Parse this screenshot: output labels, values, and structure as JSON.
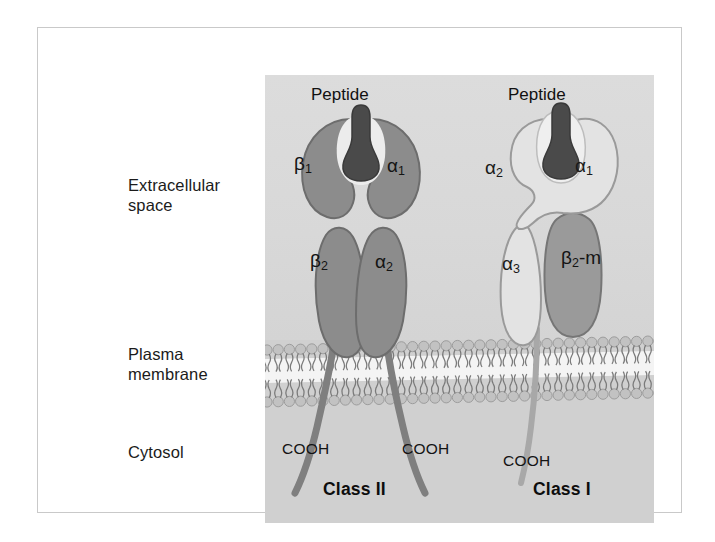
{
  "figure": {
    "panel_background": "#d3d3d3"
  },
  "region_labels": {
    "extracellular": "Extracellular\nspace",
    "plasma_membrane": "Plasma\nmembrane",
    "cytosol": "Cytosol"
  },
  "class_ii": {
    "name": "Class II",
    "peptide_label": "Peptide",
    "domains": [
      {
        "id": "beta1",
        "label": "β1",
        "greek": "β",
        "sub": "1",
        "fill": "#8c8c8c"
      },
      {
        "id": "alpha1",
        "label": "α1",
        "greek": "α",
        "sub": "1",
        "fill": "#8c8c8c"
      },
      {
        "id": "beta2",
        "label": "β2",
        "greek": "β",
        "sub": "2",
        "fill": "#8c8c8c"
      },
      {
        "id": "alpha2",
        "label": "α2",
        "greek": "α",
        "sub": "2",
        "fill": "#8c8c8c"
      }
    ],
    "termini": [
      {
        "id": "cooh-left",
        "label": "COOH"
      },
      {
        "id": "cooh-right",
        "label": "COOH"
      }
    ]
  },
  "class_i": {
    "name": "Class I",
    "peptide_label": "Peptide",
    "domains": [
      {
        "id": "alpha2",
        "label": "α2",
        "greek": "α",
        "sub": "2",
        "fill": "#e0e0e0"
      },
      {
        "id": "alpha1",
        "label": "α1",
        "greek": "α",
        "sub": "1",
        "fill": "#e0e0e0"
      },
      {
        "id": "alpha3",
        "label": "α3",
        "greek": "α",
        "sub": "3",
        "fill": "#e0e0e0"
      },
      {
        "id": "b2m",
        "label": "β2-m",
        "greek": "β",
        "sub": "2",
        "suffix": "-m",
        "fill": "#9a9a9a"
      }
    ],
    "termini": [
      {
        "id": "cooh",
        "label": "COOH"
      }
    ]
  },
  "colors": {
    "peptide": "#4a4a4a",
    "class_ii_protein": "#8c8c8c",
    "class_i_protein": "#e3e3e3",
    "b2m": "#9a9a9a",
    "membrane_head": "#bdbdbd",
    "membrane_core": "#f4f4f4",
    "panel": "#d3d3d3",
    "outline": "#6f6f6f",
    "text": "#141414"
  },
  "membrane": {
    "type": "phospholipid-bilayer",
    "description": "two leaflets of circular head groups with wavy hydrocarbon tails"
  }
}
